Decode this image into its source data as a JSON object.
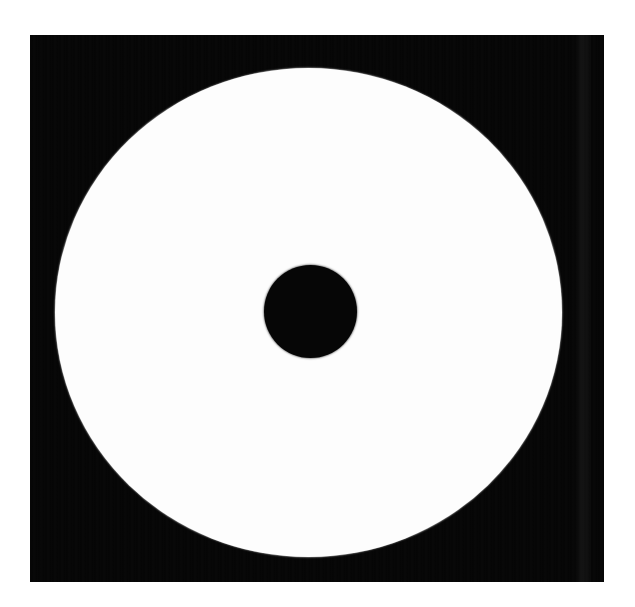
{
  "image": {
    "subject": "optical-disc",
    "description": "High-contrast black and white photograph of a blank optical disc (CD/DVD) on a black background",
    "width_px": 635,
    "height_px": 607,
    "page_background_color": "#ffffff"
  },
  "backdrop": {
    "name": "black-square-backdrop",
    "color": "#050505",
    "left_px": 30,
    "top_px": 35,
    "width_px": 574,
    "height_px": 547,
    "band": {
      "name": "scan-light-band",
      "left_px": 545,
      "width_px": 16
    }
  },
  "disc": {
    "name": "white-disc",
    "color": "#fdfdfd",
    "center_x_px": 308,
    "center_y_px": 312,
    "radius_x_px": 253,
    "radius_y_px": 244,
    "bounds": {
      "left_px": 55,
      "top_px": 68,
      "right_px": 562,
      "bottom_px": 557
    }
  },
  "spindle_hole": {
    "name": "center-hole",
    "color": "#060606",
    "center_x_px": 310,
    "center_y_px": 311,
    "radius_px": 46,
    "bounds": {
      "left_px": 264,
      "top_px": 265,
      "right_px": 357,
      "bottom_px": 358
    }
  }
}
